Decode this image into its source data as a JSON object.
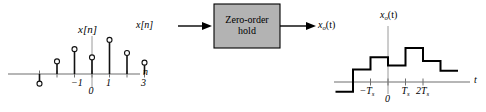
{
  "figure": {
    "title_none": "",
    "axis_color": "#6f6f6f",
    "signal_color": "#000000",
    "block_fill": "#b3b3b3",
    "block_stroke": "#000000"
  },
  "left_plot": {
    "name": "discrete-time input signal stem plot",
    "y_axis_label": "x[n]",
    "x_axis_label": "n",
    "x_tick_labels": [
      "-1",
      "0",
      "1",
      "3"
    ],
    "x_tick_label_values": [
      -1,
      0,
      1,
      3
    ],
    "chart_data": {
      "type": "scatter",
      "title": "x[n]",
      "xlabel": "n",
      "ylabel": "x[n]",
      "x": [
        -3,
        -2,
        -1,
        0,
        1,
        2,
        3
      ],
      "values": [
        -0.55,
        0.72,
        1.42,
        0.95,
        1.95,
        1.2,
        0.65
      ],
      "xlim": [
        -4,
        4
      ],
      "ylim": [
        -1.2,
        2.6
      ],
      "grid": false,
      "legend": "none",
      "marker": "open-circle",
      "stem": true
    }
  },
  "block_diagram": {
    "name": "zero-order-hold block diagram",
    "input_label": "x[n]",
    "block_label_line1": "Zero-order",
    "block_label_line2": "hold",
    "output_label_base": "x",
    "output_label_sub": "o",
    "output_label_tail": "(t)"
  },
  "right_plot": {
    "name": "zero-order-hold output staircase plot",
    "y_axis_label_base": "x",
    "y_axis_label_sub": "o",
    "y_axis_label_tail": "(t)",
    "x_axis_label": "t",
    "x_tick_labels": [
      "-T",
      "0",
      "T",
      "2T"
    ],
    "x_tick_subscripts": [
      "s",
      "",
      "s",
      "s"
    ],
    "chart_data": {
      "type": "line",
      "title": "x_o(t)",
      "xlabel": "t",
      "ylabel": "x_o(t)",
      "style": "staircase",
      "x_edges": [
        -3,
        -2,
        -1,
        0,
        1,
        2,
        3,
        4
      ],
      "values": [
        -0.55,
        0.72,
        1.42,
        0.95,
        1.95,
        1.2,
        0.65
      ],
      "tick_positions": [
        -1,
        0,
        1,
        2
      ],
      "xlim": [
        -4,
        4.6
      ],
      "ylim": [
        -1.2,
        2.6
      ],
      "grid": false,
      "legend": "none"
    }
  }
}
